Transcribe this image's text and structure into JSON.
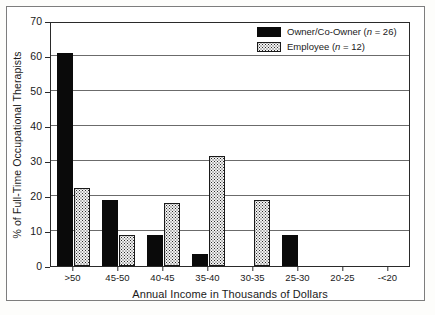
{
  "chart_data": {
    "type": "bar",
    "title": "",
    "xlabel": "Annual Income in Thousands of Dollars",
    "ylabel": "% of Full-Time Occupational Therapists",
    "categories": [
      ">50",
      "45-50",
      "40-45",
      "35-40",
      "30-35",
      "25-30",
      "20-25",
      "-<20"
    ],
    "series": [
      {
        "name": "Owner/Co-Owner (n = 26)",
        "legend_text": "Owner/Co-Owner (n = 26)",
        "swatch": "solid-black",
        "values": [
          60.8,
          19.0,
          8.8,
          3.5,
          0,
          8.8,
          0,
          0
        ]
      },
      {
        "name": "Employee (n = 12)",
        "legend_text": "Employee (n = 12)",
        "swatch": "stippled",
        "values": [
          22.3,
          9.0,
          18.0,
          31.5,
          19.0,
          0,
          0,
          0
        ]
      }
    ],
    "ylim": [
      0,
      70
    ],
    "yticks": [
      0,
      10,
      20,
      30,
      40,
      50,
      60,
      70
    ],
    "ytick_labels": [
      "0",
      "10",
      "20",
      "30",
      "40",
      "50",
      "60",
      "70"
    ],
    "grid": true,
    "grid_axis": "y",
    "legend_position": "top-right",
    "colors": {
      "owner": "#0a0a0a",
      "employee_fill": "#f2f2f2",
      "employee_dots": "#2b2b2b",
      "axis": "#2a2a2a",
      "gridline": "#6b6b6b",
      "background": "#ffffff",
      "frame": "#7d7d7d"
    }
  }
}
